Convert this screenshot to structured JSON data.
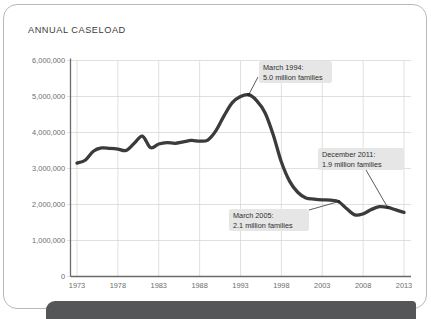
{
  "card": {
    "title": "ANNUAL CASELOAD"
  },
  "chart_data": {
    "type": "line",
    "title": "ANNUAL CASELOAD",
    "xlabel": "",
    "ylabel": "",
    "grid": true,
    "legend": "none",
    "xlim": [
      1973,
      2013
    ],
    "ylim": [
      0,
      6000000
    ],
    "ytick_labels": [
      "6,000,000",
      "5,000,000",
      "4,000,000",
      "3,000,000",
      "2,000,000",
      "1,000,000",
      "0"
    ],
    "ytick_values": [
      6000000,
      5000000,
      4000000,
      3000000,
      2000000,
      1000000,
      0
    ],
    "xtick_labels": [
      "1973",
      "1978",
      "1983",
      "1988",
      "1993",
      "1998",
      "2003",
      "2008",
      "2013"
    ],
    "xtick_values": [
      1973,
      1978,
      1983,
      1988,
      1993,
      1998,
      2003,
      2008,
      2013
    ],
    "series": [
      {
        "name": "Annual caseload",
        "x": [
          1973,
          1974,
          1975,
          1976,
          1977,
          1978,
          1979,
          1980,
          1981,
          1982,
          1983,
          1984,
          1985,
          1986,
          1987,
          1988,
          1989,
          1990,
          1991,
          1992,
          1993,
          1994,
          1995,
          1996,
          1997,
          1998,
          1999,
          2000,
          2001,
          2002,
          2003,
          2004,
          2005,
          2006,
          2007,
          2008,
          2009,
          2010,
          2011,
          2012,
          2013
        ],
        "values": [
          3150000,
          3230000,
          3480000,
          3570000,
          3560000,
          3540000,
          3500000,
          3700000,
          3900000,
          3580000,
          3680000,
          3720000,
          3700000,
          3740000,
          3780000,
          3760000,
          3790000,
          4050000,
          4470000,
          4830000,
          5000000,
          5050000,
          4880000,
          4550000,
          3940000,
          3180000,
          2650000,
          2340000,
          2180000,
          2150000,
          2130000,
          2120000,
          2080000,
          1880000,
          1710000,
          1740000,
          1860000,
          1940000,
          1920000,
          1850000,
          1780000
        ]
      }
    ],
    "annotations": [
      {
        "id": "march-1994",
        "line1": "March 1994:",
        "line2": "5.0 million families",
        "point_x": 1994,
        "point_y": 5050000
      },
      {
        "id": "december-2011",
        "line1": "December 2011:",
        "line2": "1.9 million families",
        "point_x": 2011,
        "point_y": 1920000
      },
      {
        "id": "march-2005",
        "line1": "March 2005:",
        "line2": "2.1 million families",
        "point_x": 2005,
        "point_y": 2080000
      }
    ]
  }
}
